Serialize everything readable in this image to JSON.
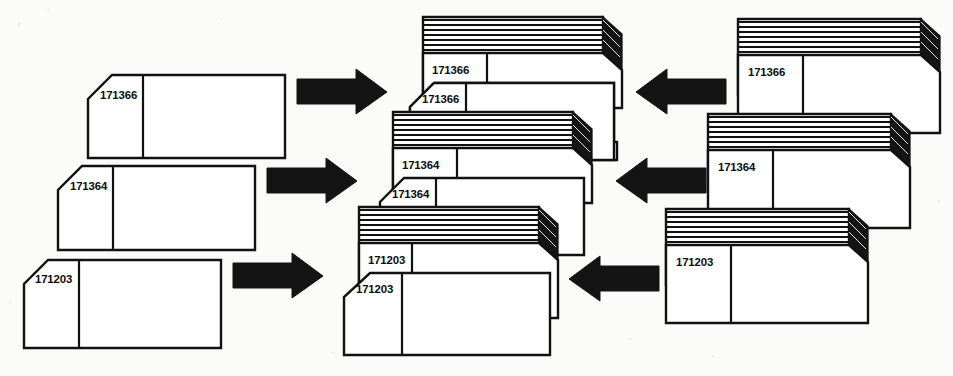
{
  "diagram": {
    "background_color": "#fbfbfa",
    "ink_color": "#111111",
    "card_fill_color": "#ffffff",
    "arrow_color": "#141414",
    "rows": [
      {
        "row_id": "row-171366",
        "label": "171366",
        "source_card_label": "171366",
        "middle_stack_label": "171366",
        "middle_front_card_label": "171366",
        "target_stack_label": "171366",
        "left_arrow_direction": "right",
        "right_arrow_direction": "left"
      },
      {
        "row_id": "row-171364",
        "label": "171364",
        "source_card_label": "171364",
        "middle_stack_label": "171364",
        "middle_front_card_label": "171364",
        "target_stack_label": "171364",
        "left_arrow_direction": "right",
        "right_arrow_direction": "left"
      },
      {
        "row_id": "row-171203",
        "label": "171203",
        "source_card_label": "171203",
        "middle_stack_label": "171203",
        "middle_front_card_label": "171203",
        "target_stack_label": "171203",
        "left_arrow_direction": "right",
        "right_arrow_direction": "left"
      }
    ],
    "icons": {
      "arrow_right": "arrow-right-icon",
      "arrow_left": "arrow-left-icon"
    },
    "stack_layer_count": 6
  }
}
